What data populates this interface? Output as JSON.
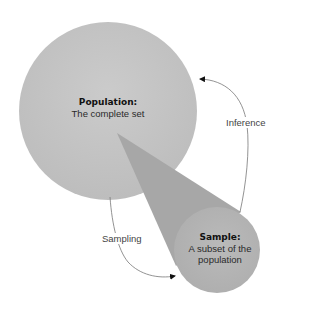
{
  "diagram": {
    "population": {
      "title": "Population:",
      "subtitle": "The complete set",
      "color": "#c3c3c3"
    },
    "sample": {
      "title": "Sample:",
      "subtitle_line1": "A subset of the",
      "subtitle_line2": "population",
      "color": "#b5b5b5"
    },
    "cone": {
      "color": "#a7a7a7"
    },
    "arrows": {
      "sampling": {
        "label": "Sampling",
        "from": "population",
        "to": "sample"
      },
      "inference": {
        "label": "Inference",
        "from": "sample",
        "to": "population"
      }
    }
  }
}
